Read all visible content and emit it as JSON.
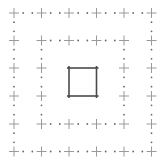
{
  "diagram": {
    "width": 166,
    "height": 165,
    "background": "#ffffff",
    "grid_positions_x": [
      14,
      41.5,
      69,
      96.5,
      124,
      151.5
    ],
    "grid_positions_y": [
      13,
      40.5,
      68,
      96,
      124,
      151.5
    ],
    "cross": {
      "arm": 5,
      "color": "#9a9a9a",
      "stroke_width": 1
    },
    "dot": {
      "radius": 0.9,
      "color": "#6a6a6a",
      "per_segment": 2
    },
    "rings": [
      {
        "name": "outer-ring",
        "index_from": 0,
        "index_to": 5
      },
      {
        "name": "middle-ring",
        "index_from": 1,
        "index_to": 4
      }
    ],
    "center_square": {
      "index_from": 2,
      "index_to": 3,
      "color": "#4a4a4a",
      "stroke_width": 1.6,
      "overshoot": 2
    }
  }
}
